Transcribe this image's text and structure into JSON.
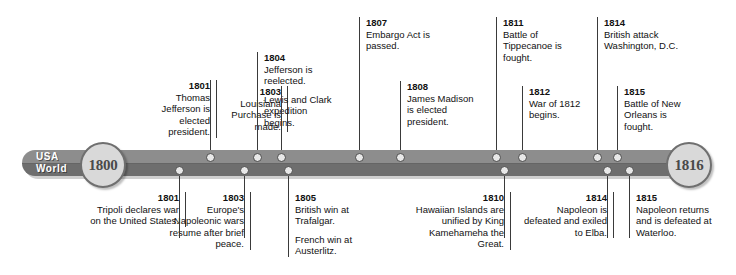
{
  "timeline": {
    "lane_labels": [
      "USA",
      "World"
    ],
    "start_year": "1800",
    "end_year": "1816",
    "events": [
      {
        "id": "usa-1801",
        "lane": "usa",
        "side": "top",
        "align": "right",
        "year": "1801",
        "paragraphs": [
          "Thomas Jefferson is elected president."
        ]
      },
      {
        "id": "usa-1803",
        "lane": "usa",
        "side": "top",
        "align": "right",
        "year": "1803",
        "paragraphs": [
          "Louisiana Purchase is made."
        ]
      },
      {
        "id": "usa-1804",
        "lane": "usa",
        "side": "top",
        "align": "left",
        "year": "1804",
        "paragraphs": [
          "Jefferson is reelected.",
          "Lewis and Clark expedition begins."
        ]
      },
      {
        "id": "usa-1807",
        "lane": "usa",
        "side": "top",
        "align": "left",
        "year": "1807",
        "paragraphs": [
          "Embargo Act is passed."
        ]
      },
      {
        "id": "usa-1808",
        "lane": "usa",
        "side": "top",
        "align": "left",
        "year": "1808",
        "paragraphs": [
          "James Madison is elected president."
        ]
      },
      {
        "id": "usa-1811",
        "lane": "usa",
        "side": "top",
        "align": "left",
        "year": "1811",
        "paragraphs": [
          "Battle of Tippecanoe is fought."
        ]
      },
      {
        "id": "usa-1812",
        "lane": "usa",
        "side": "top",
        "align": "left",
        "year": "1812",
        "paragraphs": [
          "War of 1812 begins."
        ]
      },
      {
        "id": "usa-1814",
        "lane": "usa",
        "side": "top",
        "align": "left",
        "year": "1814",
        "paragraphs": [
          "British attack Washington, D.C."
        ]
      },
      {
        "id": "usa-1815",
        "lane": "usa",
        "side": "top",
        "align": "left",
        "year": "1815",
        "paragraphs": [
          "Battle of New Orleans is fought."
        ]
      },
      {
        "id": "world-1801",
        "lane": "world",
        "side": "bottom",
        "align": "right",
        "year": "1801",
        "paragraphs": [
          "Tripoli declares war on the United States."
        ]
      },
      {
        "id": "world-1803",
        "lane": "world",
        "side": "bottom",
        "align": "right",
        "year": "1803",
        "paragraphs": [
          "Europe's Napoleonic wars resume after brief peace."
        ]
      },
      {
        "id": "world-1805",
        "lane": "world",
        "side": "bottom",
        "align": "left",
        "year": "1805",
        "paragraphs": [
          "British win at Trafalgar.",
          "French win at Austerlitz."
        ]
      },
      {
        "id": "world-1810",
        "lane": "world",
        "side": "bottom",
        "align": "right",
        "year": "1810",
        "paragraphs": [
          "Hawaiian Islands are unified by King Kamehameha the Great."
        ]
      },
      {
        "id": "world-1814",
        "lane": "world",
        "side": "bottom",
        "align": "right",
        "year": "1814",
        "paragraphs": [
          "Napoleon is defeated and exiled to Elba."
        ]
      },
      {
        "id": "world-1815",
        "lane": "world",
        "side": "bottom",
        "align": "left",
        "year": "1815",
        "paragraphs": [
          "Napoleon returns and is defeated at Waterloo."
        ]
      }
    ]
  }
}
